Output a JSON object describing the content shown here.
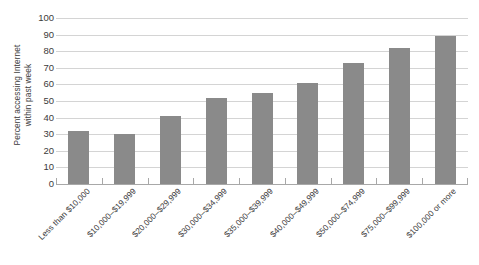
{
  "chart_data": {
    "type": "bar",
    "title": "",
    "subtitle": "",
    "xlabel": "",
    "ylabel": "Percent accessing Internet within past week",
    "ylabel_lines": [
      "Percent accessing Internet",
      "within past week"
    ],
    "categories": [
      "Less than $10,000",
      "$10,000–$19,999",
      "$20,000–$29,999",
      "$30,000–$34,999",
      "$35,000–$39,999",
      "$40,000–$49,999",
      "$50,000–$74,999",
      "$75,000–$99,999",
      "$100,000 or more"
    ],
    "values": [
      32,
      30,
      41,
      52,
      55,
      61,
      73,
      82,
      89
    ],
    "ylim": [
      0,
      100
    ],
    "ytick_step": 10,
    "yticks": [
      100,
      90,
      80,
      70,
      60,
      50,
      40,
      30,
      20,
      10,
      0
    ],
    "grid": true,
    "grid_axis": "y",
    "legend": false,
    "legend_position": "none",
    "bar_color": "#8a8a8a",
    "gridline_color": "#d4d4d4",
    "axis_color": "#a8a8a8",
    "background_color": "#ffffff",
    "text_color": "#3b3b3b",
    "xtick_rotation_deg": -45
  }
}
